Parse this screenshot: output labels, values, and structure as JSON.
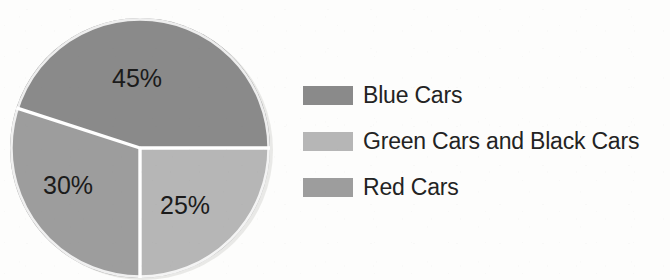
{
  "chart_data": {
    "type": "pie",
    "title": "",
    "subtitle": "",
    "xlabel": "",
    "ylabel": "",
    "categories": [
      "Blue Cars",
      "Green Cars and Black Cars",
      "Red Cars"
    ],
    "values": [
      45,
      25,
      30
    ],
    "value_labels": [
      "45%",
      "25%",
      "30%"
    ],
    "value_unit": "%",
    "colors": [
      "#8a8a8a",
      "#b6b6b6",
      "#9d9d9d"
    ],
    "legend_position": "right",
    "grid": false,
    "slices": [
      {
        "label": "Blue Cars",
        "value": 45,
        "value_label": "45%",
        "color": "#8a8a8a",
        "start_angle_deg": 0,
        "end_angle_deg": 162
      },
      {
        "label": "Red Cars",
        "value": 30,
        "value_label": "30%",
        "color": "#9d9d9d",
        "start_angle_deg": 162,
        "end_angle_deg": 270
      },
      {
        "label": "Green Cars and Black Cars",
        "value": 25,
        "value_label": "25%",
        "color": "#b6b6b6",
        "start_angle_deg": 270,
        "end_angle_deg": 360
      }
    ]
  },
  "pie": {
    "labels": [
      {
        "text": "45%",
        "x": 137,
        "y": 78
      },
      {
        "text": "30%",
        "x": 68,
        "y": 185
      },
      {
        "text": "25%",
        "x": 185,
        "y": 205
      }
    ]
  },
  "legend": {
    "items": [
      {
        "label": "Blue Cars",
        "color": "#8a8a8a"
      },
      {
        "label": "Green Cars and Black Cars",
        "color": "#b6b6b6"
      },
      {
        "label": "Red Cars",
        "color": "#9d9d9d"
      }
    ]
  },
  "colors": {
    "background": "#fdfdfc",
    "slice_divider": "#ffffff",
    "text": "#232323"
  }
}
